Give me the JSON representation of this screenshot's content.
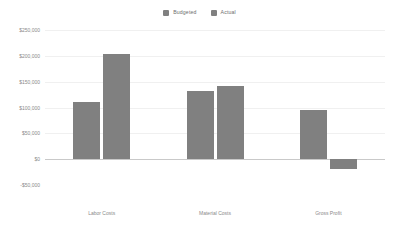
{
  "chart_data": {
    "type": "bar",
    "title": "",
    "subtitle": "",
    "xlabel": "",
    "ylabel": "",
    "categories": [
      "Labor Costs",
      "Material Costs",
      "Gross Profit"
    ],
    "series": [
      {
        "name": "Budgeted",
        "color": "#808080",
        "values": [
          111000,
          132000,
          95000
        ]
      },
      {
        "name": "Actual",
        "color": "#808080",
        "values": [
          204000,
          142000,
          -20000
        ]
      }
    ],
    "ylim": [
      -50000,
      250000
    ],
    "yticks": [
      250000,
      200000,
      150000,
      100000,
      50000,
      0,
      -50000
    ],
    "ytick_labels": [
      "$250,000",
      "$200,000",
      "$150,000",
      "$100,000",
      "$50,000",
      "$0",
      "-$50,000"
    ],
    "grid": true,
    "legend_position": "top-center",
    "bar_color": "#808080",
    "gridline_color": "#f0f0f0",
    "zeroline_color": "#c9c9c9",
    "axis_text_color": "#8a8a8a",
    "background": "#ffffff"
  },
  "legend": {
    "items": [
      {
        "label": "Budgeted",
        "swatch_name": "legend-swatch-budgeted"
      },
      {
        "label": "Actual",
        "swatch_name": "legend-swatch-actual"
      }
    ]
  }
}
